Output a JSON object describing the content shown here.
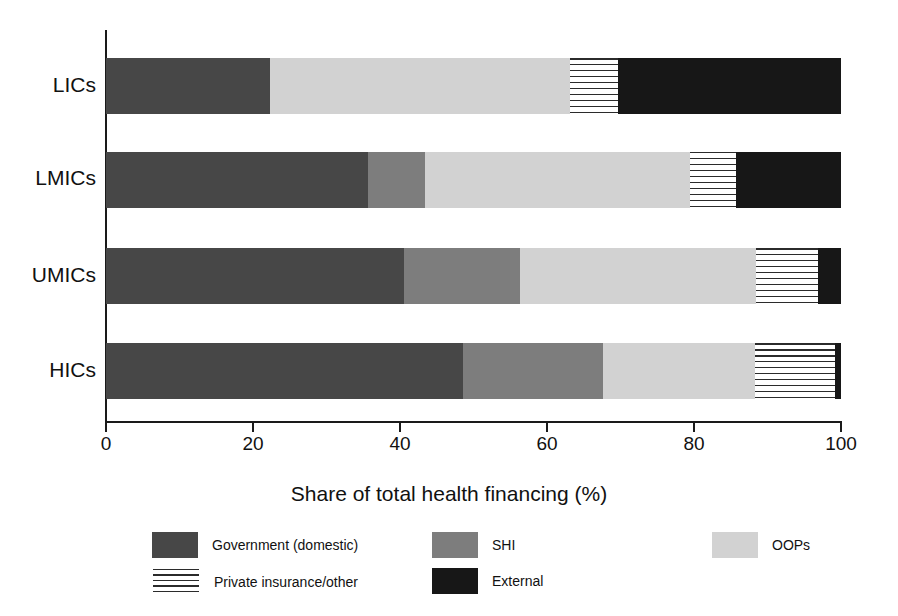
{
  "chart_data": {
    "type": "bar",
    "orientation": "horizontal",
    "stacked": true,
    "title": "",
    "xlabel": "Share of total health financing (%)",
    "ylabel": "",
    "xlim": [
      0,
      100
    ],
    "xticks": [
      0,
      20,
      40,
      60,
      80,
      100
    ],
    "xtick_labels": [
      "0",
      "20",
      "40",
      "60",
      "80",
      "100"
    ],
    "grid": false,
    "legend_position": "bottom",
    "categories": [
      "LICs",
      "LMICs",
      "UMICs",
      "HICs"
    ],
    "series": [
      {
        "name": "Government (domestic)",
        "color": "#474747",
        "pattern": "solid",
        "values": [
          22.3,
          35.6,
          40.5,
          48.6
        ]
      },
      {
        "name": "SHI",
        "color": "#7d7d7d",
        "pattern": "solid",
        "values": [
          0.0,
          7.8,
          15.8,
          19.0
        ]
      },
      {
        "name": "OOPs",
        "color": "#d2d2d2",
        "pattern": "solid",
        "values": [
          40.8,
          36.1,
          32.1,
          20.7
        ]
      },
      {
        "name": "Private insurance/other",
        "color": "#ffffff",
        "pattern": "horizontal-lines",
        "values": [
          6.6,
          6.2,
          8.5,
          10.9
        ]
      },
      {
        "name": "External",
        "color": "#171717",
        "pattern": "solid",
        "values": [
          30.3,
          14.3,
          3.1,
          0.8
        ]
      }
    ]
  },
  "axis": {
    "x_title": "Share of total health financing (%)",
    "tick_labels": [
      "0",
      "20",
      "40",
      "60",
      "80",
      "100"
    ],
    "category_labels": [
      "LICs",
      "LMICs",
      "UMICs",
      "HICs"
    ]
  },
  "legend": {
    "items": [
      {
        "label": "Government (domestic)",
        "icon": "solid-dark-gray-swatch"
      },
      {
        "label": "SHI",
        "icon": "solid-medium-gray-swatch"
      },
      {
        "label": "OOPs",
        "icon": "solid-light-gray-swatch"
      },
      {
        "label": "Private insurance/other",
        "icon": "horizontal-line-hatch-swatch"
      },
      {
        "label": "External",
        "icon": "solid-black-swatch"
      }
    ]
  },
  "colors": {
    "government": "#474747",
    "shi": "#7d7d7d",
    "oops": "#d2d2d2",
    "private": "#ffffff",
    "external": "#171717",
    "axis": "#1a1a1a",
    "background": "#ffffff"
  }
}
